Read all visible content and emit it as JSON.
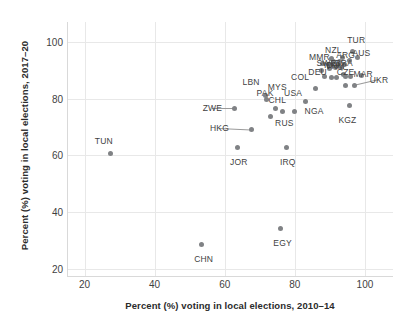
{
  "chart_data": {
    "type": "scatter",
    "title": "",
    "xlabel": "Percent (%) voting in local elections, 2010–14",
    "ylabel": "Percent (%) voting in local elections, 2017–20",
    "xlim": [
      15,
      108
    ],
    "ylim": [
      17,
      107
    ],
    "xticks": [
      20,
      40,
      60,
      80,
      100
    ],
    "yticks": [
      20,
      40,
      60,
      80,
      100
    ],
    "grid": true,
    "legend": "none",
    "marker_color": "#808285",
    "label_color": "#3f3f3f",
    "gridline_color": "#e8e8e8",
    "background": "#ffffff",
    "points": [
      {
        "label": "TUN",
        "x": 27.5,
        "y": 60.5,
        "lx": 25.5,
        "ly": 65.0
      },
      {
        "label": "CHN",
        "x": 53.5,
        "y": 28.5,
        "lx": 54.0,
        "ly": 23.5
      },
      {
        "label": "EGY",
        "x": 76.0,
        "y": 34.0,
        "lx": 76.5,
        "ly": 29.0
      },
      {
        "label": "JOR",
        "x": 63.5,
        "y": 62.7,
        "lx": 64.0,
        "ly": 57.5
      },
      {
        "label": "IRQ",
        "x": 77.5,
        "y": 62.7,
        "lx": 78.0,
        "ly": 57.5
      },
      {
        "label": "HKG",
        "x": 67.5,
        "y": 69.0,
        "lx": 58.5,
        "ly": 69.5,
        "leader": true
      },
      {
        "label": "ZWE",
        "x": 62.8,
        "y": 76.5,
        "lx": 56.5,
        "ly": 76.5,
        "leader": true
      },
      {
        "label": "PAK",
        "x": 72.0,
        "y": 79.5,
        "lx": 71.5,
        "ly": 82.0
      },
      {
        "label": "CHL",
        "x": 74.5,
        "y": 76.5,
        "lx": 75.0,
        "ly": 79.5
      },
      {
        "label": "RUS",
        "x": 76.5,
        "y": 75.5,
        "lx": 77.0,
        "ly": 71.5
      },
      {
        "label": "LBN",
        "x": 71.5,
        "y": 81.0,
        "lx": 67.5,
        "ly": 86.0
      },
      {
        "label": "MYS",
        "x": 73.0,
        "y": 73.5,
        "lx": 75.0,
        "ly": 84.0
      },
      {
        "label": "USA",
        "x": 80.0,
        "y": 75.5,
        "lx": 79.5,
        "ly": 82.0
      },
      {
        "label": "COL",
        "x": 83.0,
        "y": 78.8,
        "lx": 81.5,
        "ly": 87.5
      },
      {
        "label": "NGA",
        "x": 86.0,
        "y": 83.5,
        "lx": 85.5,
        "ly": 75.5
      },
      {
        "label": "KGZ",
        "x": 95.5,
        "y": 77.5,
        "lx": 95.0,
        "ly": 72.5
      },
      {
        "label": "UKR",
        "x": 97.0,
        "y": 84.5,
        "lx": 104.0,
        "ly": 86.5,
        "leader": true
      },
      {
        "label": "",
        "x": 94.5,
        "y": 84.5
      },
      {
        "label": "DEU",
        "x": 88.5,
        "y": 87.8,
        "lx": 86.5,
        "ly": 89.5
      },
      {
        "label": "",
        "x": 90.5,
        "y": 87.5
      },
      {
        "label": "",
        "x": 92.0,
        "y": 87.5
      },
      {
        "label": "",
        "x": 94.5,
        "y": 87.8
      },
      {
        "label": "",
        "x": 96.0,
        "y": 87.8
      },
      {
        "label": "CZE",
        "x": 94.0,
        "y": 88.5,
        "lx": 94.5,
        "ly": 89.5
      },
      {
        "label": "MMR",
        "x": 88.0,
        "y": 92.5,
        "lx": 87.0,
        "ly": 94.5
      },
      {
        "label": "NZL",
        "x": 90.5,
        "y": 94.0,
        "lx": 91.0,
        "ly": 97.0
      },
      {
        "label": "AUS",
        "x": 98.0,
        "y": 94.5,
        "lx": 99.0,
        "ly": 96.0
      },
      {
        "label": "TUR",
        "x": 96.5,
        "y": 96.5,
        "lx": 97.5,
        "ly": 100.5
      },
      {
        "label": "ARG",
        "x": 93.5,
        "y": 94.5,
        "lx": 94.5,
        "ly": 95.5
      },
      {
        "label": "BRA",
        "x": 92.5,
        "y": 92.0,
        "lx": 94.0,
        "ly": 92.5
      },
      {
        "label": "IDN",
        "x": 90.5,
        "y": 91.5,
        "lx": 90.5,
        "ly": 92.0
      },
      {
        "label": "VNM",
        "x": 91.5,
        "y": 91.0,
        "lx": 91.5,
        "ly": 91.5
      },
      {
        "label": "SWE",
        "x": 89.5,
        "y": 92.0,
        "lx": 89.0,
        "ly": 92.5
      },
      {
        "label": "",
        "x": 91.0,
        "y": 93.2
      },
      {
        "label": "",
        "x": 92.8,
        "y": 93.0
      },
      {
        "label": "",
        "x": 89.8,
        "y": 90.5
      },
      {
        "label": "",
        "x": 93.2,
        "y": 90.8
      },
      {
        "label": "",
        "x": 94.2,
        "y": 92.0
      },
      {
        "label": "MAR",
        "x": 99.0,
        "y": 88.0,
        "lx": 99.5,
        "ly": 88.5
      },
      {
        "label": "",
        "x": 87.5,
        "y": 90.0
      },
      {
        "label": "",
        "x": 95.5,
        "y": 93.5
      }
    ]
  }
}
